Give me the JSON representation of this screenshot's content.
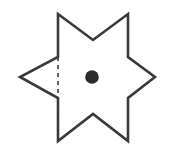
{
  "figure": {
    "title": "Six-pointed star outline with center point and dashed chord",
    "canvas": {
      "width": 174,
      "height": 158,
      "background_color": "#ffffff"
    },
    "star": {
      "name": "six-pointed-star",
      "stroke_color": "#3a3a3a",
      "stroke_width": 2.6,
      "fill": "none",
      "points": "58,14 93,40 128,14 128,57 155,77 128,98 128,141 93,114 58,141 58,98 20,77 58,57",
      "vertices": [
        {
          "label": "top-left-point",
          "x": 58,
          "y": 14,
          "kind": "convex"
        },
        {
          "label": "top-notch",
          "x": 93,
          "y": 40,
          "kind": "concave"
        },
        {
          "label": "top-right-point",
          "x": 128,
          "y": 14,
          "kind": "convex"
        },
        {
          "label": "right-upper-notch",
          "x": 128,
          "y": 57,
          "kind": "concave"
        },
        {
          "label": "right-point",
          "x": 155,
          "y": 77,
          "kind": "convex"
        },
        {
          "label": "right-lower-notch",
          "x": 128,
          "y": 98,
          "kind": "concave"
        },
        {
          "label": "bottom-right-point",
          "x": 128,
          "y": 141,
          "kind": "convex"
        },
        {
          "label": "bottom-notch",
          "x": 93,
          "y": 114,
          "kind": "concave"
        },
        {
          "label": "bottom-left-point",
          "x": 58,
          "y": 141,
          "kind": "convex"
        },
        {
          "label": "left-lower-notch",
          "x": 58,
          "y": 98,
          "kind": "concave"
        },
        {
          "label": "left-point",
          "x": 20,
          "y": 77,
          "kind": "convex"
        },
        {
          "label": "left-upper-notch",
          "x": 58,
          "y": 57,
          "kind": "concave"
        }
      ]
    },
    "dashed_chord": {
      "name": "dashed-chord",
      "x1": 58,
      "y1": 57,
      "x2": 58,
      "y2": 98,
      "stroke_color": "#3a3a3a",
      "stroke_width": 1.6,
      "dash_pattern": "4 4",
      "orientation": "vertical"
    },
    "center_dot": {
      "name": "center-dot",
      "cx": 92,
      "cy": 77,
      "r": 6.8,
      "fill_color": "#2b2b2b"
    }
  }
}
